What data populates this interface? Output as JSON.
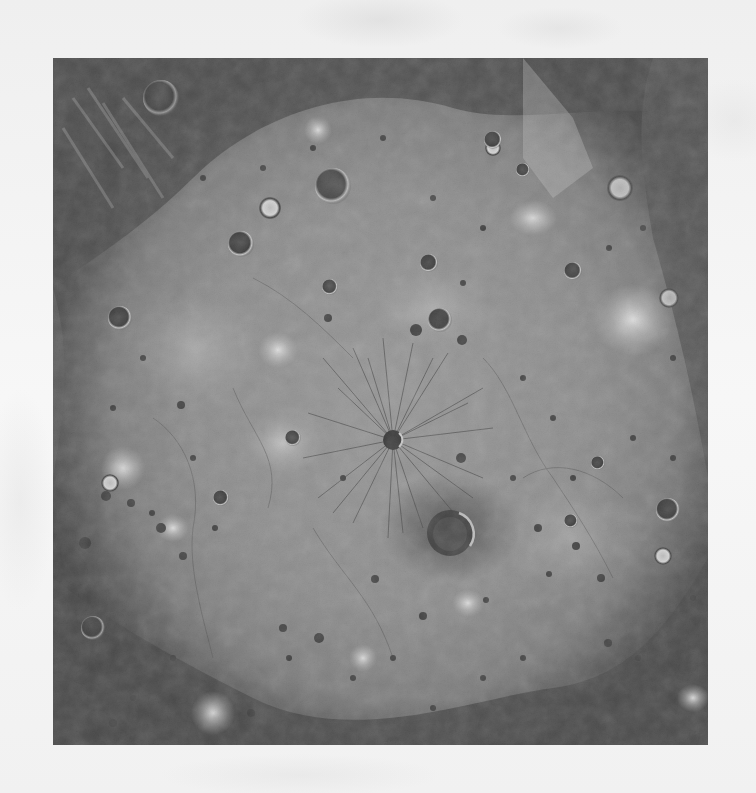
{
  "image": {
    "subject": "grayscale orbital photograph of a large impact basin floor",
    "frame": {
      "left": 53,
      "top": 58,
      "width": 655,
      "height": 687
    },
    "colors": {
      "page_background": "#f4f4f4",
      "rim_dark": "#2e2e2e",
      "floor_mid": "#8a8a8a",
      "floor_light": "#b8b8b8",
      "bright_spot": "#f0f0f0"
    },
    "features": {
      "central_radial_crater": {
        "x": 340,
        "y": 382,
        "r": 10
      },
      "large_crater": {
        "x": 397,
        "y": 475,
        "r": 22
      }
    }
  }
}
